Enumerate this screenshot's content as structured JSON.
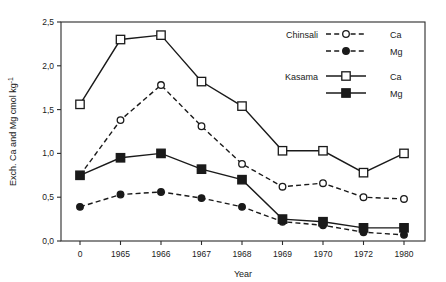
{
  "chart_data": {
    "type": "line",
    "title": "",
    "xlabel": "Year",
    "ylabel": "Exch. Ca and Mg cmol kg-1",
    "ylabel_parts": {
      "main": "Exch. Ca and Mg  cmol kg",
      "sup": "-1"
    },
    "categories": [
      "0",
      "1965",
      "1966",
      "1967",
      "1968",
      "1969",
      "1970",
      "1972",
      "1980"
    ],
    "ylim": [
      0.0,
      2.5
    ],
    "ytick_labels": [
      "0,0",
      "0,5",
      "1,0",
      "1,5",
      "2,0",
      "2,5"
    ],
    "ytick_values": [
      0.0,
      0.5,
      1.0,
      1.5,
      2.0,
      2.5
    ],
    "grid": false,
    "legend_position": "top-right inside",
    "series": [
      {
        "name": "Chinsali Ca",
        "group": "Chinsali",
        "analyte": "Ca",
        "line": "dashed",
        "marker": "open-circle",
        "values": [
          0.75,
          1.38,
          1.78,
          1.31,
          0.88,
          0.62,
          0.66,
          0.5,
          0.48
        ]
      },
      {
        "name": "Chinsali Mg",
        "group": "Chinsali",
        "analyte": "Mg",
        "line": "dashed",
        "marker": "filled-circle",
        "values": [
          0.39,
          0.53,
          0.56,
          0.49,
          0.39,
          0.22,
          0.18,
          0.1,
          0.07
        ]
      },
      {
        "name": "Kasama Ca",
        "group": "Kasama",
        "analyte": "Ca",
        "line": "solid",
        "marker": "open-square",
        "values": [
          1.56,
          2.3,
          2.35,
          1.82,
          1.54,
          1.03,
          1.03,
          0.78,
          1.0
        ]
      },
      {
        "name": "Kasama Mg",
        "group": "Kasama",
        "analyte": "Mg",
        "line": "solid",
        "marker": "filled-square",
        "values": [
          0.75,
          0.95,
          1.0,
          0.82,
          0.7,
          0.25,
          0.22,
          0.15,
          0.15
        ]
      }
    ]
  },
  "legend": {
    "groups": [
      {
        "label": "Chinsali",
        "entries": [
          {
            "label": "Ca"
          },
          {
            "label": "Mg"
          }
        ]
      },
      {
        "label": "Kasama",
        "entries": [
          {
            "label": "Ca"
          },
          {
            "label": "Mg"
          }
        ]
      }
    ]
  },
  "colors": {
    "ink": "#1a1a1a",
    "background": "#ffffff"
  }
}
